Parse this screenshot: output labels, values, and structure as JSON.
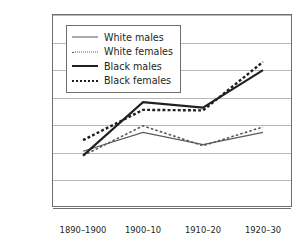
{
  "chart_data": {
    "type": "line",
    "title": "",
    "xlabel": "",
    "ylabel": "Rate per 1,000",
    "categories": [
      "1890–1900",
      "1900–10",
      "1910–20",
      "1920–30"
    ],
    "ylim": [
      0,
      350
    ],
    "ytick_values": [
      0,
      50,
      100,
      150,
      200,
      250,
      300,
      350
    ],
    "ytick_labels": [
      "0",
      "50",
      "100",
      "150",
      "200",
      "250",
      "300",
      "350"
    ],
    "grid": true,
    "legend_position": "upper-left-inside",
    "series": [
      {
        "name": "White males",
        "style": "thin-solid",
        "color": "#58595b",
        "values": [
          103,
          137,
          115,
          137
        ]
      },
      {
        "name": "White females",
        "style": "thin-dashed",
        "color": "#58595b",
        "values": [
          95,
          149,
          113,
          147
        ]
      },
      {
        "name": "Black males",
        "style": "thick-solid",
        "color": "#231f20",
        "values": [
          95,
          192,
          182,
          250
        ]
      },
      {
        "name": "Black females",
        "style": "thick-dashed",
        "color": "#231f20",
        "values": [
          123,
          178,
          177,
          265
        ]
      }
    ]
  },
  "axis": {
    "y_title": "Rate per 1,000"
  },
  "legend": {
    "items": [
      {
        "label": "White males"
      },
      {
        "label": "White females"
      },
      {
        "label": "Black males"
      },
      {
        "label": "Black females"
      }
    ]
  }
}
